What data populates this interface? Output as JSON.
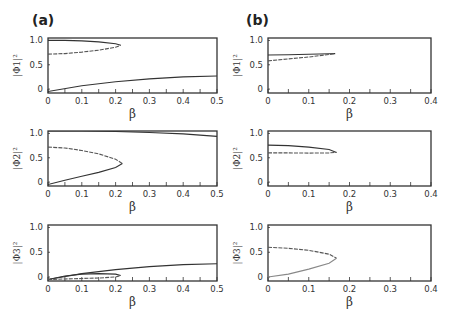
{
  "figure": {
    "panel_labels": [
      "(a)",
      "(b)"
    ]
  },
  "chart_data": [
    {
      "id": "a1",
      "type": "line",
      "column": "a",
      "row": 1,
      "xlabel": "β",
      "ylabel": "|Φ1|²",
      "xlim": [
        0,
        0.5
      ],
      "ylim": [
        0,
        1.0
      ],
      "xticks": [
        "0",
        "0.1",
        "0.2",
        "0.3",
        "0.4",
        "0.5"
      ],
      "yticks": [
        "0",
        "0.5",
        "1.0"
      ],
      "series": [
        {
          "name": "upper-branch",
          "style": "solid",
          "x": [
            0,
            0.05,
            0.1,
            0.15,
            0.2,
            0.215
          ],
          "y": [
            1.0,
            1.0,
            0.99,
            0.97,
            0.93,
            0.9
          ]
        },
        {
          "name": "lower-branch",
          "style": "dashed",
          "x": [
            0,
            0.05,
            0.1,
            0.15,
            0.2,
            0.215
          ],
          "y": [
            0.72,
            0.73,
            0.76,
            0.8,
            0.86,
            0.9
          ]
        },
        {
          "name": "rising-branch",
          "style": "solid",
          "x": [
            0,
            0.1,
            0.2,
            0.3,
            0.4,
            0.5
          ],
          "y": [
            -0.05,
            0.07,
            0.15,
            0.21,
            0.25,
            0.27
          ]
        }
      ]
    },
    {
      "id": "a2",
      "type": "line",
      "column": "a",
      "row": 2,
      "xlabel": "β",
      "ylabel": "|Φ2|²",
      "xlim": [
        0,
        0.5
      ],
      "ylim": [
        0,
        1.0
      ],
      "xticks": [
        "0",
        "0.1",
        "0.2",
        "0.3",
        "0.4",
        "0.5"
      ],
      "yticks": [
        "0",
        "0.5",
        "1.0"
      ],
      "series": [
        {
          "name": "top-branch",
          "style": "solid",
          "x": [
            0,
            0.1,
            0.2,
            0.3,
            0.4,
            0.5
          ],
          "y": [
            1.05,
            1.05,
            1.04,
            1.02,
            0.99,
            0.94
          ]
        },
        {
          "name": "upper-branch",
          "style": "dashed",
          "x": [
            0,
            0.05,
            0.1,
            0.15,
            0.2,
            0.22
          ],
          "y": [
            0.72,
            0.7,
            0.65,
            0.58,
            0.47,
            0.38
          ]
        },
        {
          "name": "lower-branch",
          "style": "solid",
          "x": [
            0,
            0.05,
            0.1,
            0.15,
            0.2,
            0.22
          ],
          "y": [
            -0.05,
            0.04,
            0.12,
            0.2,
            0.3,
            0.38
          ]
        }
      ]
    },
    {
      "id": "a3",
      "type": "line",
      "column": "a",
      "row": 3,
      "xlabel": "β",
      "ylabel": "|Φ3|²",
      "xlim": [
        0,
        0.5
      ],
      "ylim": [
        0,
        1.0
      ],
      "xticks": [
        "0",
        "0.1",
        "0.2",
        "0.3",
        "0.4",
        "0.5"
      ],
      "yticks": [
        "0",
        "0.5",
        "1.0"
      ],
      "series": [
        {
          "name": "rising-branch",
          "style": "solid",
          "x": [
            0,
            0.1,
            0.2,
            0.3,
            0.4,
            0.5
          ],
          "y": [
            -0.05,
            0.07,
            0.15,
            0.21,
            0.25,
            0.27
          ]
        },
        {
          "name": "loop-upper",
          "style": "solid",
          "x": [
            0,
            0.05,
            0.1,
            0.15,
            0.2,
            0.215
          ],
          "y": [
            -0.05,
            0.02,
            0.06,
            0.07,
            0.06,
            0.03
          ]
        },
        {
          "name": "loop-lower",
          "style": "dashed",
          "x": [
            0,
            0.05,
            0.1,
            0.15,
            0.2,
            0.215
          ],
          "y": [
            -0.05,
            -0.04,
            -0.03,
            -0.02,
            0.0,
            0.03
          ]
        }
      ]
    },
    {
      "id": "b1",
      "type": "line",
      "column": "b",
      "row": 1,
      "xlabel": "β",
      "ylabel": "|Φ1|²",
      "xlim": [
        0,
        0.4
      ],
      "ylim": [
        0,
        1.0
      ],
      "xticks": [
        "0",
        "0.1",
        "0.2",
        "0.3",
        "0.4"
      ],
      "yticks": [
        "0",
        "0.5",
        "1.0"
      ],
      "series": [
        {
          "name": "upper-branch",
          "style": "solid",
          "x": [
            0,
            0.05,
            0.1,
            0.15,
            0.165
          ],
          "y": [
            0.7,
            0.705,
            0.715,
            0.725,
            0.73
          ]
        },
        {
          "name": "lower-branch",
          "style": "dashed",
          "x": [
            0,
            0.05,
            0.1,
            0.15,
            0.165
          ],
          "y": [
            0.58,
            0.62,
            0.66,
            0.71,
            0.73
          ]
        }
      ]
    },
    {
      "id": "b2",
      "type": "line",
      "column": "b",
      "row": 2,
      "xlabel": "β",
      "ylabel": "|Φ2|²",
      "xlim": [
        0,
        0.4
      ],
      "ylim": [
        0,
        1.0
      ],
      "xticks": [
        "0",
        "0.1",
        "0.2",
        "0.3",
        "0.4"
      ],
      "yticks": [
        "0",
        "0.5",
        "1.0"
      ],
      "series": [
        {
          "name": "upper-branch",
          "style": "solid",
          "x": [
            0,
            0.05,
            0.1,
            0.15,
            0.168
          ],
          "y": [
            0.76,
            0.75,
            0.72,
            0.67,
            0.61
          ]
        },
        {
          "name": "lower-branch",
          "style": "dashed",
          "x": [
            0,
            0.05,
            0.1,
            0.15,
            0.168
          ],
          "y": [
            0.6,
            0.6,
            0.595,
            0.6,
            0.61
          ]
        }
      ]
    },
    {
      "id": "b3",
      "type": "line",
      "column": "b",
      "row": 3,
      "xlabel": "β",
      "ylabel": "|Φ3|²",
      "xlim": [
        0,
        0.4
      ],
      "ylim": [
        0,
        1.0
      ],
      "xticks": [
        "0",
        "0.1",
        "0.2",
        "0.3",
        "0.4"
      ],
      "yticks": [
        "0",
        "0.5",
        "1.0"
      ],
      "series": [
        {
          "name": "upper-branch",
          "style": "dashed",
          "x": [
            0,
            0.05,
            0.1,
            0.15,
            0.168
          ],
          "y": [
            0.6,
            0.58,
            0.54,
            0.46,
            0.38
          ]
        },
        {
          "name": "lower-branch",
          "style": "light",
          "x": [
            0,
            0.05,
            0.1,
            0.15,
            0.168
          ],
          "y": [
            0.0,
            0.06,
            0.16,
            0.28,
            0.38
          ]
        }
      ]
    }
  ]
}
